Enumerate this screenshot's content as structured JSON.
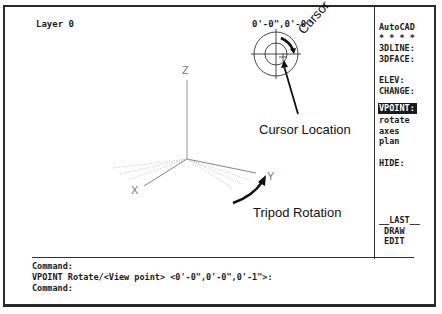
{
  "status": {
    "layer": "Layer 0",
    "coordinates": "0'-0\",0'-0\""
  },
  "side_menu": {
    "items": [
      {
        "label": "AutoCAD",
        "selected": false
      },
      {
        "label": "* * * *",
        "selected": false
      },
      {
        "label": "3DLINE:",
        "selected": false
      },
      {
        "label": "3DFACE:",
        "selected": false
      },
      {
        "label": "",
        "selected": false
      },
      {
        "label": "ELEV:",
        "selected": false
      },
      {
        "label": "CHANGE:",
        "selected": false
      },
      {
        "label": "VPOINT:",
        "selected": true
      },
      {
        "label": "rotate",
        "selected": false
      },
      {
        "label": "axes",
        "selected": false
      },
      {
        "label": "plan",
        "selected": false
      },
      {
        "label": "",
        "selected": false
      },
      {
        "label": "HIDE:",
        "selected": false
      }
    ],
    "bottom_items": [
      {
        "label": "__LAST__"
      },
      {
        "label": " DRAW"
      },
      {
        "label": " EDIT"
      }
    ]
  },
  "tripod": {
    "x_label": "X",
    "y_label": "Y",
    "z_label": "Z"
  },
  "annotations": {
    "cursor": "Cursor",
    "cursor_location": "Cursor Location",
    "tripod_rotation": "Tripod Rotation"
  },
  "command_area": {
    "lines": [
      "Command:",
      "VPOINT Rotate/<View point> <0'-0\",0'-0\",0'-1\">:",
      "Command:"
    ]
  },
  "colors": {
    "frame": "#2a2a2a",
    "text": "#1a1a1a",
    "axis": "#777777",
    "highlight_bg": "#1a1a1a",
    "highlight_fg": "#ffffff"
  }
}
